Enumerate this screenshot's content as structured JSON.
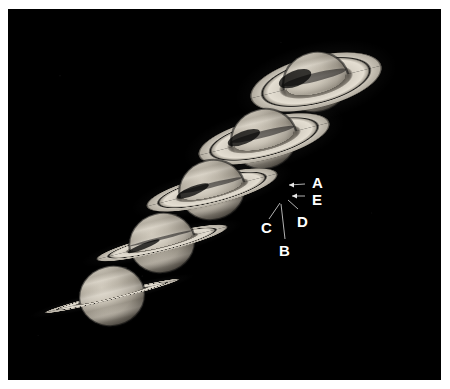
{
  "figure": {
    "background_color": "#000000",
    "paper_color": "#ffffff",
    "label_color": "#ffffff",
    "planet_body_color": "#b9b2a6",
    "ring_color": "#cfc9bd"
  },
  "planets": [
    {
      "id": "saturn-1",
      "name": "saturn-rings-wide-open",
      "cx": 316,
      "cy": 82,
      "body_rx": 33,
      "body_ry": 30,
      "ring_rx": 68,
      "ring_ry": 26,
      "tilt_deg": -14,
      "openness": "maximum",
      "z": 1
    },
    {
      "id": "saturn-2",
      "name": "saturn-rings-open",
      "cx": 264,
      "cy": 139,
      "body_rx": 33,
      "body_ry": 30,
      "ring_rx": 68,
      "ring_ry": 21,
      "tilt_deg": -14,
      "openness": "wide",
      "z": 2
    },
    {
      "id": "saturn-3",
      "name": "saturn-rings-moderate",
      "cx": 212,
      "cy": 190,
      "body_rx": 33,
      "body_ry": 30,
      "ring_rx": 68,
      "ring_ry": 15,
      "tilt_deg": -14,
      "openness": "moderate",
      "z": 3
    },
    {
      "id": "saturn-4",
      "name": "saturn-rings-narrow",
      "cx": 162,
      "cy": 243,
      "body_rx": 33,
      "body_ry": 30,
      "ring_rx": 68,
      "ring_ry": 9,
      "tilt_deg": -14,
      "openness": "narrow",
      "z": 4
    },
    {
      "id": "saturn-5",
      "name": "saturn-rings-edge-on",
      "cx": 112,
      "cy": 296,
      "body_rx": 33,
      "body_ry": 30,
      "ring_rx": 70,
      "ring_ry": 4,
      "tilt_deg": -14,
      "openness": "nearly edge-on",
      "z": 5
    }
  ],
  "ring_labels": [
    {
      "id": "label-a",
      "text": "A",
      "x": 312,
      "y": 175,
      "points_to": "A ring outer edge"
    },
    {
      "id": "label-e",
      "text": "E",
      "x": 312,
      "y": 192,
      "points_to": "E ring"
    },
    {
      "id": "label-d",
      "text": "D",
      "x": 297,
      "y": 214,
      "points_to": "D ring"
    },
    {
      "id": "label-c",
      "text": "C",
      "x": 261,
      "y": 220,
      "points_to": "C ring"
    },
    {
      "id": "label-b",
      "text": "B",
      "x": 279,
      "y": 243,
      "points_to": "B ring"
    }
  ],
  "leader_lines": [
    {
      "id": "leader-a",
      "from_x": 305,
      "from_y": 184,
      "to_x": 289,
      "to_y": 185,
      "arrow": "left"
    },
    {
      "id": "leader-e",
      "from_x": 305,
      "from_y": 196,
      "to_x": 292,
      "to_y": 196,
      "arrow": "left"
    },
    {
      "id": "leader-d",
      "from_x": 298,
      "from_y": 209,
      "to_x": 288,
      "to_y": 200,
      "arrow": "none"
    },
    {
      "id": "leader-c",
      "from_x": 269,
      "from_y": 219,
      "to_x": 280,
      "to_y": 203,
      "arrow": "none"
    },
    {
      "id": "leader-b",
      "from_x": 285,
      "from_y": 239,
      "to_x": 281,
      "to_y": 204,
      "arrow": "none"
    }
  ]
}
